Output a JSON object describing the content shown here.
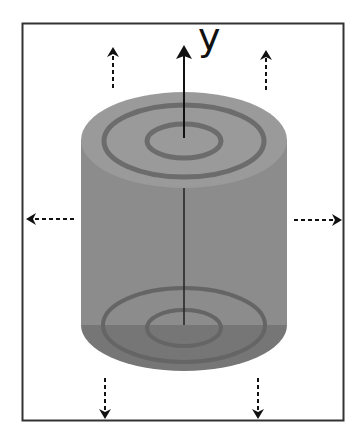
{
  "diagram": {
    "title": "",
    "axis_label": "y",
    "colors": {
      "frame": "#333333",
      "top_face": "#9a9a9a",
      "top_ring": "#6c6c6c",
      "body": "#8c8c8c",
      "bottom_face": "#767676",
      "bottom_ring": "#656565",
      "arrow": "#111111"
    },
    "elements": [
      {
        "id": "frame",
        "type": "rectangle"
      },
      {
        "id": "cylinder",
        "type": "cylinder",
        "top_rings": 2,
        "bottom_rings": 2
      },
      {
        "id": "y-axis-arrow",
        "type": "solid-arrow",
        "direction": "up"
      },
      {
        "id": "expansion-arrows",
        "type": "dashed-arrows",
        "directions": [
          "up",
          "up",
          "left",
          "right",
          "down",
          "down"
        ]
      }
    ]
  }
}
